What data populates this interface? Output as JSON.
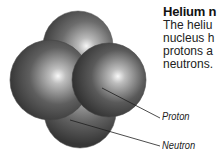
{
  "diagram": {
    "title": "Helium n",
    "description_lines": [
      "The heliu",
      "nucleus h",
      "protons a",
      "neutrons."
    ],
    "labels": {
      "proton": "Proton",
      "neutron": "Neutron"
    },
    "colors": {
      "sphere_dark": "#2e2e2e",
      "sphere_mid": "#6a6a6a",
      "sphere_highlight": "#f4f4f4",
      "leader_line": "#555555"
    }
  }
}
